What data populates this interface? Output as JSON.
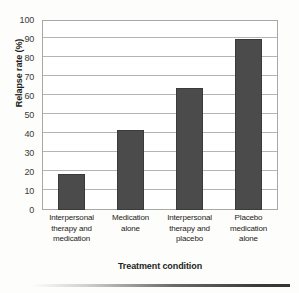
{
  "chart_data": {
    "type": "bar",
    "title": "",
    "xlabel": "Treatment condition",
    "ylabel": "Relapse rate (%)",
    "categories": [
      "Interpersonal therapy and medication",
      "Medication alone",
      "Interpersonal therapy and placebo",
      "Placebo medication alone"
    ],
    "values": [
      19,
      42,
      64,
      90
    ],
    "ylim": [
      0,
      100
    ],
    "ytick_labels": [
      "0",
      "10",
      "20",
      "30",
      "40",
      "50",
      "60",
      "70",
      "80",
      "90",
      "100"
    ],
    "ytick_values": [
      0,
      10,
      20,
      30,
      40,
      50,
      60,
      70,
      80,
      90,
      100
    ],
    "grid": "horizontal",
    "legend": "none",
    "bar_color": "#4b4b4b",
    "bar_edge_color": "#3a3a3a",
    "plot_border_color": "#a8a8a8",
    "gridline_color": "#b4b4b4"
  },
  "axes": {
    "y_title": "Relapse rate (%)",
    "x_title": "Treatment condition"
  },
  "category_label_lines": [
    [
      "Interpersonal",
      "therapy and",
      "medication"
    ],
    [
      "Medication",
      "alone"
    ],
    [
      "Interpersonal",
      "therapy and",
      "placebo"
    ],
    [
      "Placebo",
      "medication",
      "alone"
    ]
  ]
}
